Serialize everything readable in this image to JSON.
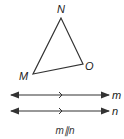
{
  "triangle": {
    "vertices": [
      {
        "label": "N",
        "x": 61,
        "y": 18
      },
      {
        "label": "M",
        "x": 33,
        "y": 74
      },
      {
        "label": "O",
        "x": 83,
        "y": 64
      }
    ]
  },
  "lines": [
    {
      "label": "m",
      "y": 95
    },
    {
      "label": "n",
      "y": 111
    }
  ],
  "caption": "m∥n",
  "colors": {
    "stroke": "#333333",
    "text": "#222222"
  }
}
